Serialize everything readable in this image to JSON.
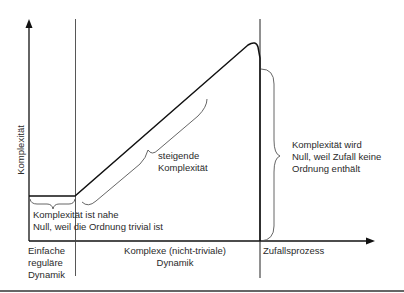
{
  "diagram": {
    "y_axis_label": "Komplexität",
    "regions": [
      {
        "id": "einfach",
        "lines": [
          "Einfache",
          "reguläre",
          "Dynamik"
        ]
      },
      {
        "id": "komplex",
        "lines": [
          "Komplexe (nicht-triviale)",
          "Dynamik"
        ]
      },
      {
        "id": "zufall",
        "lines": [
          "Zufallsprozess"
        ]
      }
    ],
    "annotations": {
      "near_zero": [
        "Komplexität ist nahe",
        "Null, weil die Ordnung trivial ist"
      ],
      "rising": [
        "steigende",
        "Komplexität"
      ],
      "random_zero": [
        "Komplexität wird",
        "Null, weil Zufall keine",
        "Ordnung enthält"
      ]
    },
    "colors": {
      "line": "#111111",
      "brace": "#555555",
      "text": "#2a2a2a",
      "divider": "#444444"
    }
  }
}
